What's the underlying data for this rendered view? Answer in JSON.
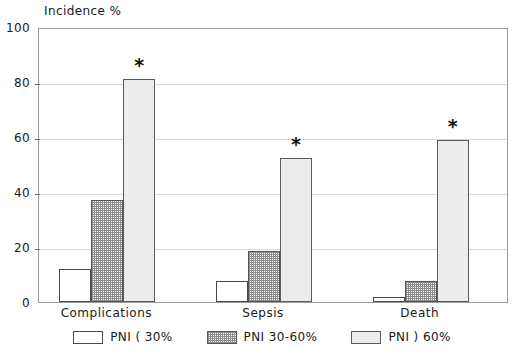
{
  "chart_data": {
    "type": "bar",
    "title": "",
    "ylabel": "Incidence %",
    "xlabel": "",
    "ylim": [
      0,
      100
    ],
    "yticks": [
      0,
      20,
      40,
      60,
      80,
      100
    ],
    "grid": true,
    "legend_position": "bottom",
    "categories": [
      "Complications",
      "Sepsis",
      "Death"
    ],
    "series": [
      {
        "name": "PNI ( 30%",
        "values": [
          12,
          7.5,
          2
        ]
      },
      {
        "name": "PNI 30-60%",
        "values": [
          37,
          18.5,
          7.5
        ]
      },
      {
        "name": "PNI ) 60%",
        "values": [
          81,
          52.5,
          59
        ]
      }
    ],
    "annotations": [
      {
        "text": "*",
        "category": "Complications",
        "series": "PNI ) 60%"
      },
      {
        "text": "*",
        "category": "Sepsis",
        "series": "PNI ) 60%"
      },
      {
        "text": "*",
        "category": "Death",
        "series": "PNI ) 60%"
      }
    ]
  },
  "axis": {
    "y_title": "Incidence %",
    "tick_labels": [
      "0",
      "20",
      "40",
      "60",
      "80",
      "100"
    ],
    "category_labels": [
      "Complications",
      "Sepsis",
      "Death"
    ]
  },
  "legend": {
    "items": [
      {
        "label": "PNI ( 30%",
        "swatch": "swatch-white"
      },
      {
        "label": "PNI 30-60%",
        "swatch": "swatch-hatch"
      },
      {
        "label": "PNI ) 60%",
        "swatch": "swatch-light"
      }
    ]
  },
  "colors": {
    "frame": "#9a9a9a",
    "gridline": "#d8d8d8",
    "bar_outline": "#4a4a4a",
    "bar_white": "#ffffff",
    "bar_hatch": "#8d8d8d",
    "bar_light": "#ececec",
    "text": "#1a1a1a"
  },
  "marker": {
    "significance": "*"
  }
}
